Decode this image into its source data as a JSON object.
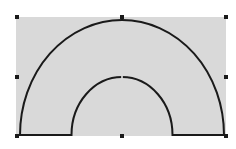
{
  "canvas": {
    "background": "#ffffff"
  },
  "shape": {
    "type": "block-arc",
    "fill": "#d9d9d9",
    "stroke": "#1a1a1a",
    "stroke_width": 2,
    "bounds": {
      "x": 16,
      "y": 17,
      "width": 210,
      "height": 119
    },
    "center": {
      "x": 122,
      "y": 135
    },
    "outer_radius": {
      "rx": 102,
      "ry": 115
    },
    "inner_radius": {
      "rx": 50.5,
      "ry": 58
    }
  },
  "selection": {
    "handle_color": "#1a1a1a",
    "handle_size": 4,
    "handles": [
      {
        "name": "top-left",
        "x": 17,
        "y": 17
      },
      {
        "name": "top-middle",
        "x": 122,
        "y": 17
      },
      {
        "name": "top-right",
        "x": 226,
        "y": 17
      },
      {
        "name": "middle-left",
        "x": 17,
        "y": 77
      },
      {
        "name": "middle-right",
        "x": 226,
        "y": 77
      },
      {
        "name": "bottom-left",
        "x": 17,
        "y": 136
      },
      {
        "name": "bottom-middle",
        "x": 122,
        "y": 136
      },
      {
        "name": "bottom-right",
        "x": 226,
        "y": 136
      }
    ],
    "adjust_handle": {
      "x": 122,
      "y": 77
    }
  }
}
